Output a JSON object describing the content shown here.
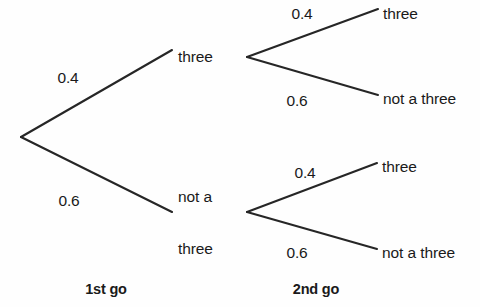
{
  "diagram": {
    "type": "probability-tree",
    "title_visible": false,
    "line_color": "#262626",
    "text_color": "#1a1a1a",
    "background_color": "#fefefe",
    "stages": [
      {
        "id": "stage-1",
        "label": "1st go"
      },
      {
        "id": "stage-2",
        "label": "2nd go"
      }
    ],
    "root": {
      "id": "root",
      "x": 21,
      "y": 137
    },
    "branches_stage1": [
      {
        "id": "branch-1-three",
        "probability": "0.4",
        "outcome": "three",
        "prob_x": 68,
        "prob_y": 78,
        "node_x": 247,
        "node_y": 57,
        "label_x": 178,
        "label_y": 57,
        "from_x": 21,
        "from_y": 137,
        "to_x": 172,
        "to_y": 50
      },
      {
        "id": "branch-1-not-a-three",
        "probability": "0.6",
        "outcome_line1": "not a",
        "outcome_line2": "three",
        "prob_x": 69,
        "prob_y": 201,
        "node_x": 247,
        "node_y": 212,
        "label_x": 178,
        "label_y": 222,
        "from_x": 21,
        "from_y": 137,
        "to_x": 172,
        "to_y": 212
      }
    ],
    "branches_stage2": [
      {
        "id": "branch-2a-three",
        "parent": "three",
        "probability": "0.4",
        "outcome": "three",
        "prob_x": 302,
        "prob_y": 14,
        "label_x": 383,
        "label_y": 14,
        "from_x": 247,
        "from_y": 57,
        "to_x": 378,
        "to_y": 9
      },
      {
        "id": "branch-2a-not-a-three",
        "parent": "three",
        "probability": "0.6",
        "outcome": "not a three",
        "prob_x": 297,
        "prob_y": 101,
        "label_x": 383,
        "label_y": 99,
        "from_x": 247,
        "from_y": 57,
        "to_x": 378,
        "to_y": 95
      },
      {
        "id": "branch-2b-three",
        "parent": "not a three",
        "probability": "0.4",
        "outcome": "three",
        "prob_x": 305,
        "prob_y": 173,
        "label_x": 382,
        "label_y": 167,
        "from_x": 247,
        "from_y": 212,
        "to_x": 377,
        "to_y": 163
      },
      {
        "id": "branch-2b-not-a-three",
        "parent": "not a three",
        "probability": "0.6",
        "outcome": "not a three",
        "prob_x": 297,
        "prob_y": 253,
        "label_x": 382,
        "label_y": 253,
        "from_x": 247,
        "from_y": 212,
        "to_x": 377,
        "to_y": 249
      }
    ],
    "stage_label_positions": [
      {
        "x": 106,
        "y": 289
      },
      {
        "x": 316,
        "y": 289
      }
    ]
  }
}
